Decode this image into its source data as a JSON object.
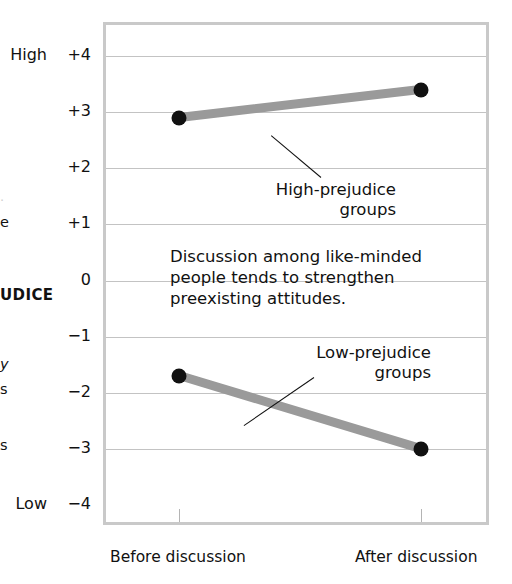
{
  "chart_data": {
    "type": "line",
    "title": "",
    "subtitle": "",
    "xlabel": "",
    "ylabel": "PREJUDICE",
    "categories": [
      "Before discussion",
      "After discussion"
    ],
    "x": [
      0,
      1
    ],
    "ylim": [
      -4,
      4
    ],
    "ytick_labels": [
      "+4",
      "+3",
      "+2",
      "+1",
      "0",
      "−1",
      "−2",
      "−3",
      "−4"
    ],
    "ytick_values": [
      4,
      3,
      2,
      1,
      0,
      -1,
      -2,
      -3,
      -4
    ],
    "y_axis_high_label": "High",
    "y_axis_low_label": "Low",
    "grid": true,
    "legend_position": "inline-callouts",
    "series": [
      {
        "name": "High-prejudice groups",
        "values": [
          2.9,
          3.4
        ],
        "color": "#9a9a9a",
        "marker_color": "#111111"
      },
      {
        "name": "Low-prejudice groups",
        "values": [
          -1.7,
          -3.0
        ],
        "color": "#9a9a9a",
        "marker_color": "#111111"
      }
    ],
    "annotations": [
      {
        "id": "polarization-note",
        "text": "Discussion among like-minded\npeople tends to strengthen\npreexisting attitudes."
      }
    ]
  },
  "axis_caption_fragments": {
    "dot": "·",
    "e": "e",
    "main": "UDICE",
    "y": "y",
    "s1": "s",
    "s2": "s"
  },
  "callouts": {
    "high": {
      "line1": "High-prejudice",
      "line2": "groups"
    },
    "low": {
      "line1": "Low-prejudice",
      "line2": "groups"
    }
  },
  "colors": {
    "series_gray": "#9a9a9a",
    "marker_black": "#111111",
    "gridline": "#c3c3c3",
    "frame": "#c9c9c9",
    "text": "#111111"
  }
}
